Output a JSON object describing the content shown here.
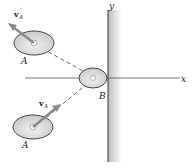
{
  "diagram": {
    "axes": {
      "x_label": "x",
      "y_label": "y"
    },
    "disk_upper": {
      "label": "A",
      "velocity_label": "v",
      "velocity_sub": "A",
      "velocity_prime": "'"
    },
    "disk_lower": {
      "label": "A",
      "velocity_label": "v",
      "velocity_sub": "A"
    },
    "disk_wall": {
      "label": "B"
    },
    "colors": {
      "disk_fill": "#d9d9d9",
      "wall_shade": "#d0d0d0",
      "line": "#333333",
      "dash": "#555555"
    }
  }
}
